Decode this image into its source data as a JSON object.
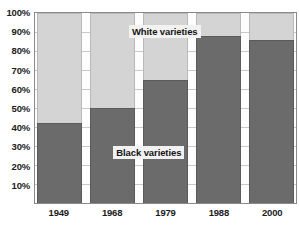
{
  "chart_data": {
    "type": "bar",
    "stacked": true,
    "percent_stacked": true,
    "title": "",
    "xlabel": "",
    "ylabel": "",
    "ylim": [
      0,
      100
    ],
    "yticks": [
      "10%",
      "20%",
      "30%",
      "40%",
      "50%",
      "60%",
      "70%",
      "80%",
      "90%",
      "100%"
    ],
    "ytick_values": [
      10,
      20,
      30,
      40,
      50,
      60,
      70,
      80,
      90,
      100
    ],
    "grid": true,
    "legend_position": "inline-annotations",
    "categories": [
      "1949",
      "1968",
      "1979",
      "1988",
      "2000"
    ],
    "series": [
      {
        "name": "Black varieties",
        "color": "#6b6b6b",
        "values": [
          42,
          50,
          65,
          88,
          86
        ]
      },
      {
        "name": "White varieties",
        "color": "#d4d4d4",
        "values": [
          58,
          50,
          35,
          12,
          14
        ]
      }
    ],
    "annotations": [
      {
        "text": "White varieties",
        "series": "White varieties"
      },
      {
        "text": "Black varieties",
        "series": "Black varieties"
      }
    ]
  }
}
